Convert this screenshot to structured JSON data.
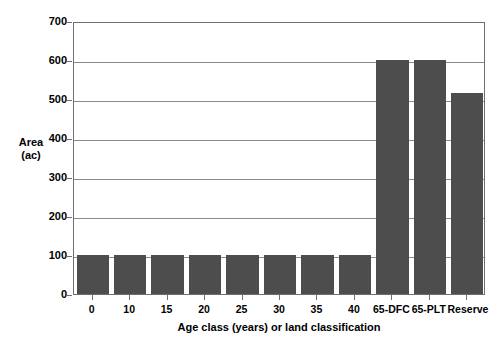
{
  "chart_data": {
    "type": "bar",
    "title": "",
    "subtitle": "",
    "xlabel": "Age class (years) or land classification",
    "ylabel": "Area (ac)",
    "ylabel_line1": "Area",
    "ylabel_line2": "(ac)",
    "categories": [
      "0",
      "10",
      "15",
      "20",
      "25",
      "30",
      "35",
      "40",
      "65-DFC",
      "65-PLT",
      "Reserve"
    ],
    "values": [
      100,
      100,
      100,
      100,
      100,
      100,
      100,
      100,
      600,
      600,
      515
    ],
    "ylim": [
      0,
      700
    ],
    "ytick_values": [
      0,
      100,
      200,
      300,
      400,
      500,
      600,
      700
    ],
    "ytick_labels": [
      "0",
      "100",
      "200",
      "300",
      "400",
      "500",
      "600",
      "700"
    ],
    "grid": true,
    "grid_axis": "y",
    "legend": false,
    "legend_position": "none",
    "bar_color": "#4d4d4d",
    "plot_background": "#ffffff",
    "grid_color": "#8a8a8a",
    "axis_color": "#6f6f6f",
    "text_color": "#000000"
  }
}
